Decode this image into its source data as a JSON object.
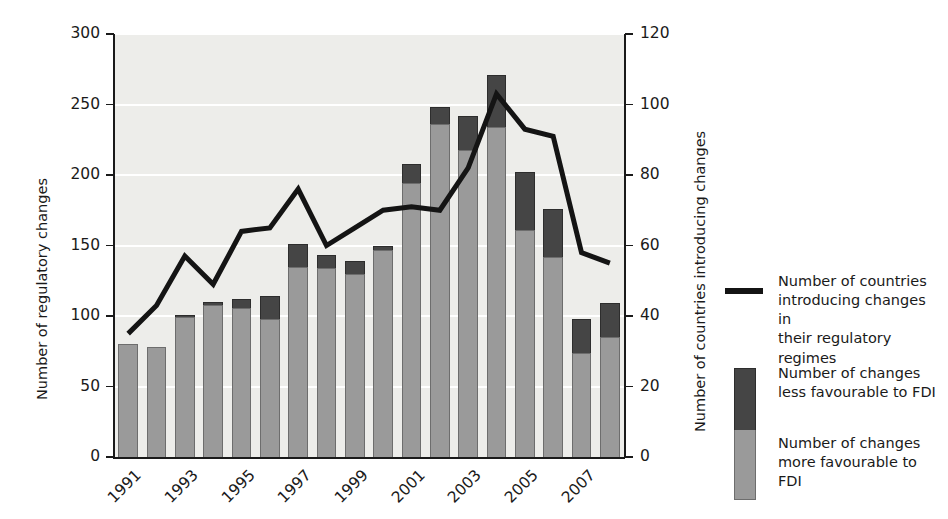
{
  "chart_data": {
    "type": "bar",
    "title": "",
    "subtitle": "",
    "xlabel": "",
    "ylabel": "Number of regulatory changes",
    "y2label": "Number of countries introducing changes",
    "ylim": [
      0,
      300
    ],
    "y2lim": [
      0,
      120
    ],
    "yticks": [
      "0",
      "50",
      "100",
      "150",
      "200",
      "250",
      "300"
    ],
    "ytick_values": [
      0,
      50,
      100,
      150,
      200,
      250,
      300
    ],
    "y2ticks": [
      "0",
      "20",
      "40",
      "60",
      "80",
      "100",
      "120"
    ],
    "y2tick_values": [
      0,
      20,
      40,
      60,
      80,
      100,
      120
    ],
    "grid": true,
    "grid_axis": "y",
    "legend_position": "right",
    "stacked": true,
    "x": [
      1991,
      1992,
      1993,
      1994,
      1995,
      1996,
      1997,
      1998,
      1999,
      2000,
      2001,
      2002,
      2003,
      2004,
      2005,
      2006,
      2007,
      2008
    ],
    "xtick_labels": [
      "1991",
      "1993",
      "1995",
      "1997",
      "1999",
      "2001",
      "2003",
      "2005",
      "2007"
    ],
    "xtick_values": [
      1991,
      1993,
      1995,
      1997,
      1999,
      2001,
      2003,
      2005,
      2007
    ],
    "series": [
      {
        "name": "Number of changes more favourable to FDI",
        "type": "bar",
        "color": "#9a9a9a",
        "axis": "left",
        "values": [
          80,
          78,
          99,
          108,
          106,
          98,
          135,
          134,
          130,
          147,
          194,
          236,
          218,
          234,
          161,
          142,
          74,
          85
        ]
      },
      {
        "name": "Number of changes less favourable to FDI",
        "type": "bar",
        "color": "#454545",
        "axis": "left",
        "values": [
          0,
          0,
          2,
          2,
          6,
          16,
          16,
          9,
          9,
          3,
          14,
          12,
          24,
          37,
          41,
          34,
          24,
          24
        ]
      },
      {
        "name": "Number of countries introducing changes in their regulatory regimes",
        "type": "line",
        "color": "#141414",
        "axis": "right",
        "values": [
          35,
          43,
          57,
          49,
          64,
          65,
          76,
          60,
          65,
          70,
          71,
          70,
          82,
          103,
          93,
          91,
          58,
          55
        ]
      }
    ],
    "totals": [
      80,
      78,
      101,
      110,
      112,
      114,
      151,
      143,
      139,
      150,
      208,
      248,
      242,
      271,
      202,
      176,
      98,
      109
    ]
  },
  "legend": {
    "items": [
      {
        "marker": "line",
        "lines": [
          "Number of countries",
          "introducing changes in",
          "their regulatory regimes"
        ]
      },
      {
        "marker": "box-dark",
        "lines": [
          "Number of changes",
          "less favourable to FDI"
        ]
      },
      {
        "marker": "box-light",
        "lines": [
          "Number of changes",
          "more favourable to FDI"
        ]
      }
    ]
  },
  "colors": {
    "bar_more": "#9a9a9a",
    "bar_less": "#454545",
    "line": "#141414",
    "plot_bg": "#ededea",
    "grid": "#ffffff",
    "axis": "#1a1a1a"
  }
}
